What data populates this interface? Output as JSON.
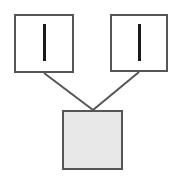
{
  "diagram": {
    "canvas": {
      "width": 177,
      "height": 176,
      "background_color": "#ffffff"
    },
    "style": {
      "node_border_color": "#555555",
      "node_border_width": 2,
      "node_fill_white": "#ffffff",
      "node_fill_gray": "#e8e8e8",
      "glyph_color": "#1a1a1a",
      "edge_color": "#555555",
      "edge_width": 2
    },
    "nodes": [
      {
        "id": "node-top-left",
        "name": "top-left-node",
        "label": "",
        "glyph": "vertical-bar",
        "x": 14,
        "y": 14,
        "width": 60,
        "height": 59,
        "fill": "#ffffff",
        "glyph_x": 43,
        "glyph_y": 24,
        "glyph_width": 3,
        "glyph_height": 37
      },
      {
        "id": "node-top-right",
        "name": "top-right-node",
        "label": "",
        "glyph": "vertical-bar",
        "x": 110,
        "y": 14,
        "width": 58,
        "height": 58,
        "fill": "#ffffff",
        "glyph_x": 138,
        "glyph_y": 24,
        "glyph_width": 3,
        "glyph_height": 37
      },
      {
        "id": "node-bottom",
        "name": "bottom-node",
        "label": "",
        "glyph": "none",
        "x": 62,
        "y": 110,
        "width": 61,
        "height": 60,
        "fill": "#e8e8e8",
        "glyph_x": 0,
        "glyph_y": 0,
        "glyph_width": 0,
        "glyph_height": 0
      }
    ],
    "edges": [
      {
        "id": "edge-left",
        "name": "edge-top-left-to-bottom",
        "from": "node-top-left",
        "to": "node-bottom",
        "x1": 44,
        "y1": 73,
        "x2": 93,
        "y2": 110
      },
      {
        "id": "edge-right",
        "name": "edge-top-right-to-bottom",
        "from": "node-top-right",
        "to": "node-bottom",
        "x1": 139,
        "y1": 72,
        "x2": 93,
        "y2": 110
      }
    ]
  }
}
